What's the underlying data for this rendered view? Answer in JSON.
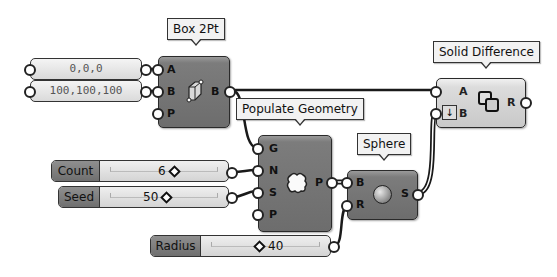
{
  "canvas": {
    "background": "#ffffff",
    "wire_color": "#1a1a1a"
  },
  "panels": [
    {
      "value": "0,0,0"
    },
    {
      "value": "100,100,100"
    }
  ],
  "box2pt": {
    "tooltip": "Box 2Pt",
    "icon": "box-icon",
    "inputs": [
      "A",
      "B",
      "P"
    ],
    "outputs": [
      "B"
    ]
  },
  "solid_difference": {
    "tooltip": "Solid Difference",
    "icon": "solid-difference-icon",
    "flatten_icon": "flatten-arrow-icon",
    "inputs": [
      "A",
      "B"
    ],
    "outputs": [
      "R"
    ]
  },
  "populate_geometry": {
    "tooltip": "Populate Geometry",
    "icon": "populate-cloud-icon",
    "inputs": [
      "G",
      "N",
      "S",
      "P"
    ],
    "outputs": [
      "P"
    ]
  },
  "sphere": {
    "tooltip": "Sphere",
    "icon": "sphere-icon",
    "inputs": [
      "B",
      "R"
    ],
    "outputs": [
      "S"
    ]
  },
  "sliders": {
    "count": {
      "label": "Count",
      "value": "6"
    },
    "seed": {
      "label": "Seed",
      "value": "50"
    },
    "radius": {
      "label": "Radius",
      "value": "40"
    }
  }
}
